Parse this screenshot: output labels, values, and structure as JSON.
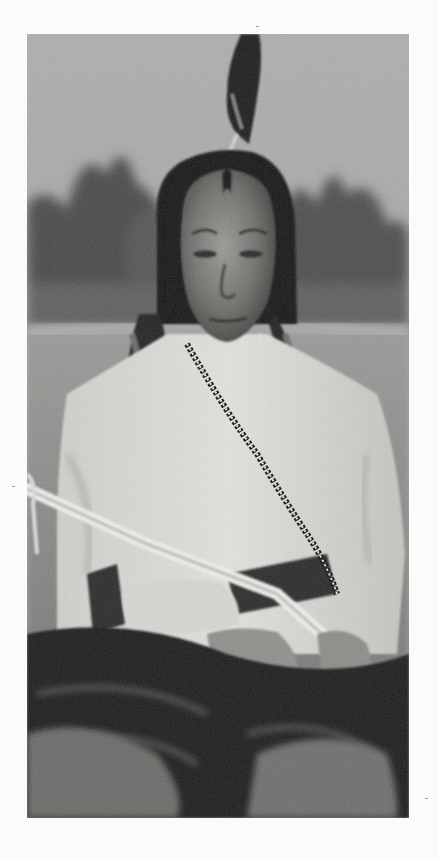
{
  "photo": {
    "alt": "Vintage black-and-white portrait of a seated Native American man with long braids, a single feather in his hair, light shirt, beaded necklace, holding a pipe, blanket across his lap",
    "palette": {
      "paper": "#fbfbf9",
      "sky": "#a9a9a7",
      "treeline": "#3a3a3a",
      "ground": "#8e8e8c",
      "shirt": "#d8d8d4",
      "skin": "#7b7b78",
      "hair": "#161616",
      "blanket": "#222222"
    }
  }
}
